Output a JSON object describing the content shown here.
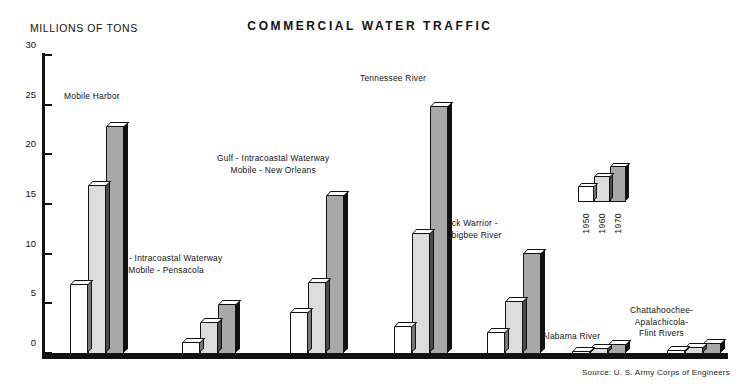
{
  "chart_title": "COMMERCIAL WATER TRAFFIC",
  "axis_title": "MILLIONS OF TONS",
  "source_note": "Source: U. S. Army Corps of Engineers",
  "legend": {
    "items": [
      {
        "label": "1950",
        "color": "#ffffff"
      },
      {
        "label": "1960",
        "color": "#dcdcdc"
      },
      {
        "label": "1970",
        "color": "#a8a8a8"
      }
    ]
  },
  "group_labels": {
    "mobile_harbor": "Mobile Harbor",
    "pensacola_l1": "Gulf - Intracoastal Waterway",
    "pensacola_l2": "Mobile - Pensacola",
    "neworleans_l1": "Gulf - Intracoastal Waterway",
    "neworleans_l2": "Mobile - New Orleans",
    "tennessee": "Tennessee River",
    "blackwarrior_l1": "Black Warrior -",
    "blackwarrior_l2": "Tombigbee River",
    "alabama": "Alabama River",
    "chattahoochee_l1": "Chattahoochee-",
    "chattahoochee_l2": "Apalachicola-",
    "chattahoochee_l3": "Flint Rivers"
  },
  "ticks": [
    "0",
    "5",
    "10",
    "15",
    "20",
    "25",
    "30"
  ],
  "chart_data": {
    "type": "bar",
    "title": "COMMERCIAL WATER TRAFFIC",
    "xlabel": "",
    "ylabel": "MILLIONS OF TONS",
    "ylim": [
      0,
      30
    ],
    "ytick_values": [
      0,
      5,
      10,
      15,
      20,
      25,
      30
    ],
    "grid": false,
    "legend_position": "upper-right",
    "categories": [
      "Mobile Harbor",
      "Gulf - Intracoastal Waterway Mobile - Pensacola",
      "Gulf - Intracoastal Waterway Mobile - New Orleans",
      "Tennessee River",
      "Black Warrior - Tombigbee River",
      "Alabama River",
      "Chattahoochee-Apalachicola-Flint Rivers"
    ],
    "series": [
      {
        "name": "1950",
        "color": "#ffffff",
        "values": [
          7.0,
          1.2,
          4.2,
          2.8,
          2.2,
          0.3,
          0.4
        ]
      },
      {
        "name": "1960",
        "color": "#dcdcdc",
        "values": [
          17.0,
          3.2,
          7.2,
          12.2,
          5.3,
          0.6,
          0.7
        ]
      },
      {
        "name": "1970",
        "color": "#a8a8a8",
        "values": [
          23.0,
          5.0,
          16.0,
          25.0,
          10.2,
          1.0,
          1.1
        ]
      }
    ],
    "source": "Source: U. S. Army Corps of Engineers"
  }
}
